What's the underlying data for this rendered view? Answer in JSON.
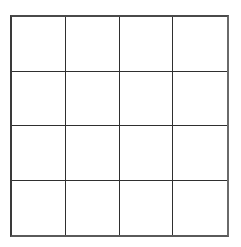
{
  "diagram": {
    "type": "grid",
    "rows": 4,
    "columns": 4,
    "cells": [
      [
        "",
        "",
        "",
        ""
      ],
      [
        "",
        "",
        "",
        ""
      ],
      [
        "",
        "",
        "",
        ""
      ],
      [
        "",
        "",
        "",
        ""
      ]
    ],
    "line_color": "#2f2f2f",
    "background": "#ffffff"
  }
}
